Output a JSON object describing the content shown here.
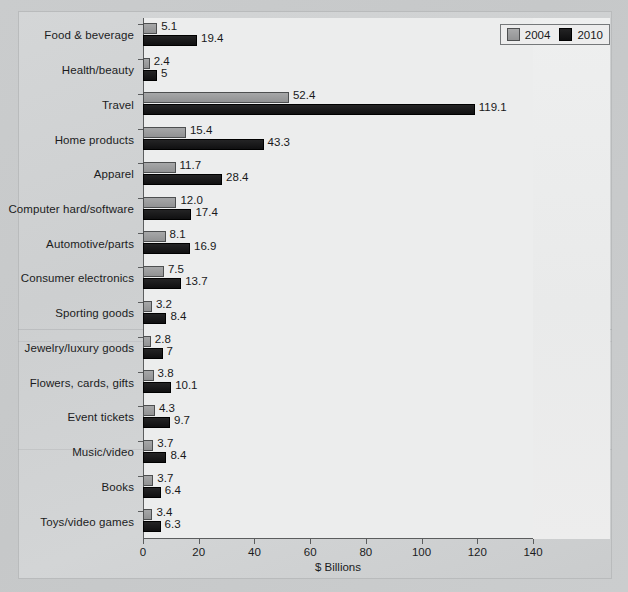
{
  "chart_data": {
    "type": "bar",
    "orientation": "horizontal",
    "title": "",
    "xlabel": "$ Billions",
    "ylabel": "",
    "xlim": [
      0,
      140
    ],
    "xticks": [
      0,
      20,
      40,
      60,
      80,
      100,
      120,
      140
    ],
    "grid": false,
    "legend_position": "top-right",
    "categories": [
      "Food & beverage",
      "Health/beauty",
      "Travel",
      "Home products",
      "Apparel",
      "Computer hard/software",
      "Automotive/parts",
      "Consumer electronics",
      "Sporting goods",
      "Jewelry/luxury goods",
      "Flowers, cards, gifts",
      "Event tickets",
      "Music/video",
      "Books",
      "Toys/video games"
    ],
    "series": [
      {
        "name": "2004",
        "color": "#9a9b9c",
        "values": [
          5.1,
          2.4,
          52.4,
          15.4,
          11.7,
          12.0,
          8.1,
          7.5,
          3.2,
          2.8,
          3.8,
          4.3,
          3.7,
          3.7,
          3.4
        ],
        "labels": [
          "5.1",
          "2.4",
          "52.4",
          "15.4",
          "11.7",
          "12.0",
          "8.1",
          "7.5",
          "3.2",
          "2.8",
          "3.8",
          "4.3",
          "3.7",
          "3.7",
          "3.4"
        ]
      },
      {
        "name": "2010",
        "color": "#19191a",
        "values": [
          19.4,
          5,
          119.1,
          43.3,
          28.4,
          17.4,
          16.9,
          13.7,
          8.4,
          7,
          10.1,
          9.7,
          8.4,
          6.4,
          6.3
        ],
        "labels": [
          "19.4",
          "5",
          "119.1",
          "43.3",
          "28.4",
          "17.4",
          "16.9",
          "13.7",
          "8.4",
          "7",
          "10.1",
          "9.7",
          "8.4",
          "6.4",
          "6.3"
        ]
      }
    ]
  },
  "legend": {
    "items": [
      {
        "label": "2004",
        "swatch": "gray-swatch-icon"
      },
      {
        "label": "2010",
        "swatch": "black-swatch-icon"
      }
    ]
  },
  "axis": {
    "x_title": "$ Billions",
    "tick_labels": [
      "0",
      "20",
      "40",
      "60",
      "80",
      "100",
      "120",
      "140"
    ]
  }
}
